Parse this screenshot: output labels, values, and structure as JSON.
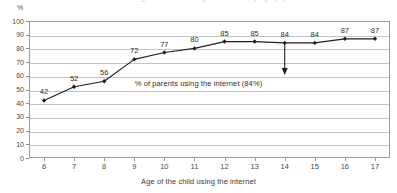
{
  "title_sliver": "Percentage of children using the internet, by age (%)",
  "axes": {
    "y_unit": "%",
    "y_ticks": [
      "100",
      "90",
      "80",
      "70",
      "60",
      "50",
      "40",
      "30",
      "20",
      "10",
      "0"
    ],
    "x_title": "Age of the child using the internet",
    "x_ticks": [
      "6",
      "7",
      "8",
      "9",
      "10",
      "11",
      "12",
      "13",
      "14",
      "15",
      "16",
      "17"
    ]
  },
  "annotation": {
    "text": "% of parents using the internet (84%)",
    "value": 84,
    "arrow_at_category": "14"
  },
  "colors": {
    "line": "#231f20",
    "grid": "#c4c4c4",
    "frame": "#9a9a9a",
    "text": "#3b3b3b"
  },
  "chart_data": {
    "type": "line",
    "title": "Percentage of children using the internet, by age (%)",
    "xlabel": "Age of the child using the internet",
    "ylabel": "%",
    "categories": [
      6,
      7,
      8,
      9,
      10,
      11,
      12,
      13,
      14,
      15,
      16,
      17
    ],
    "values": [
      42,
      52,
      56,
      72,
      77,
      80,
      85,
      85,
      84,
      84,
      87,
      87
    ],
    "data_labels": [
      "42",
      "52",
      "56",
      "72",
      "77",
      "80",
      "85",
      "85",
      "84",
      "84",
      "87",
      "87"
    ],
    "ylim": [
      0,
      100
    ],
    "ytick_step": 10,
    "xlim": [
      6,
      17
    ],
    "grid": "horizontal",
    "legend": "none",
    "markers": true,
    "annotations": [
      {
        "text": "% of parents using the internet (84%)",
        "value": 84,
        "points_to_category": 14,
        "style": "down-arrow"
      }
    ]
  }
}
